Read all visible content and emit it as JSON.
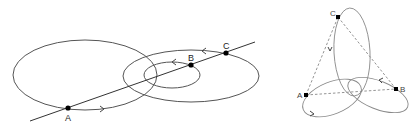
{
  "left_diagram": {
    "points": {
      "A": {
        "label": "A"
      },
      "B": {
        "label": "B"
      },
      "C": {
        "label": "C"
      }
    },
    "description": "Three coaxial-like orbits: large ellipse through A, medium ellipse through C, small ellipse through B, with a straight line through A, B, C"
  },
  "right_diagram": {
    "points": {
      "A": {
        "label": "A"
      },
      "B": {
        "label": "B"
      },
      "C": {
        "label": "C"
      }
    },
    "description": "Three intersecting ellipses through A, B, C with dashed triangle connecting the points"
  }
}
